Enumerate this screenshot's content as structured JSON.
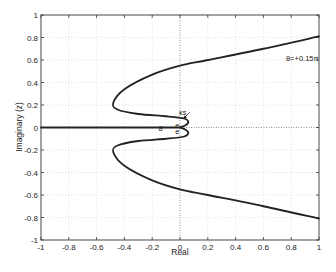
{
  "chart_data": {
    "type": "line",
    "title": "",
    "xlabel": "Real",
    "ylabel": "Imaginary (z)",
    "xlim": [
      -1,
      1
    ],
    "ylim": [
      -1,
      1
    ],
    "grid": true,
    "xticks": [
      "-1",
      "-0.8",
      "-0.6",
      "-0.4",
      "-0.2",
      "0",
      "0.2",
      "0.4",
      "0.6",
      "0.8",
      "1"
    ],
    "yticks": [
      "1",
      "0.8",
      "0.6",
      "0.4",
      "0.2",
      "0",
      "-0.2",
      "-0.4",
      "-0.6",
      "-0.8",
      "-1"
    ],
    "series": [
      {
        "name": "upper branch",
        "x": [
          1.0,
          0.6,
          0.2,
          0.0,
          -0.2,
          -0.4,
          -0.48,
          -0.45,
          -0.3,
          -0.1,
          0.03,
          0.06,
          0.04,
          0.0
        ],
        "y": [
          0.81,
          0.7,
          0.6,
          0.55,
          0.47,
          0.34,
          0.22,
          0.16,
          0.12,
          0.1,
          0.08,
          0.05,
          0.02,
          0.0
        ]
      },
      {
        "name": "lower branch",
        "x": [
          1.0,
          0.6,
          0.2,
          0.0,
          -0.2,
          -0.4,
          -0.48,
          -0.45,
          -0.3,
          -0.1,
          0.03,
          0.06,
          0.04,
          0.0
        ],
        "y": [
          -0.81,
          -0.7,
          -0.6,
          -0.55,
          -0.47,
          -0.34,
          -0.22,
          -0.16,
          -0.12,
          -0.1,
          -0.08,
          -0.05,
          -0.02,
          0.0
        ]
      },
      {
        "name": "real axis segment",
        "x": [
          -1.0,
          0.0
        ],
        "y": [
          0.0,
          0.0
        ]
      }
    ],
    "annotations": [
      {
        "text": "θ=+0.15π",
        "x": 0.88,
        "y": 0.62
      },
      {
        "text": "κs",
        "x": 0.02,
        "y": 0.14
      },
      {
        "text": "8",
        "x": -0.14,
        "y": 0.0
      },
      {
        "text": "e",
        "x": -0.02,
        "y": 0.02
      },
      {
        "text": "e",
        "x": -0.02,
        "y": -0.03
      }
    ]
  }
}
